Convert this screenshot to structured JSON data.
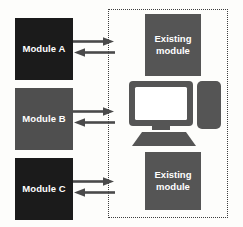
{
  "diagram": {
    "background_color": "#fdfdfb",
    "left_modules": [
      {
        "id": "module-a",
        "label": "Module A",
        "fill": "#1b1b1b",
        "text_color": "#ffffff"
      },
      {
        "id": "module-b",
        "label": "Module B",
        "fill": "#4f4f4f",
        "text_color": "#ffffff"
      },
      {
        "id": "module-c",
        "label": "Module C",
        "fill": "#1b1b1b",
        "text_color": "#ffffff"
      }
    ],
    "existing_system": {
      "border_style": "dotted",
      "border_color": "#3d3d3d",
      "top_module": {
        "line1": "Existing",
        "line2": "module",
        "fill": "#555555"
      },
      "bottom_module": {
        "line1": "Existing",
        "line2": "module",
        "fill": "#555555"
      },
      "computer": {
        "icon_name": "desktop-computer-icon",
        "body_color": "#555555",
        "screen_color": "#ffffff"
      }
    },
    "connections": [
      {
        "from": "module-a",
        "to": "existing-system",
        "direction": "right",
        "style": "solid-arrow",
        "color": "#4a4a4a"
      },
      {
        "from": "existing-system",
        "to": "module-a",
        "direction": "left",
        "style": "solid-arrow",
        "color": "#4a4a4a"
      },
      {
        "from": "module-b",
        "to": "existing-system",
        "direction": "right",
        "style": "solid-arrow",
        "color": "#4a4a4a"
      },
      {
        "from": "existing-system",
        "to": "module-b",
        "direction": "left",
        "style": "solid-arrow",
        "color": "#4a4a4a"
      },
      {
        "from": "module-c",
        "to": "existing-system",
        "direction": "right",
        "style": "solid-arrow",
        "color": "#4a4a4a"
      },
      {
        "from": "existing-system",
        "to": "module-c",
        "direction": "left",
        "style": "solid-arrow",
        "color": "#4a4a4a"
      }
    ]
  }
}
